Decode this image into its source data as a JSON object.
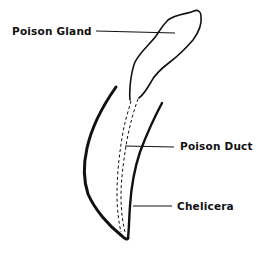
{
  "diagram": {
    "labels": {
      "gland": "Poison Gland",
      "duct": "Poison Duct",
      "chelicera": "Chelicera"
    },
    "colors": {
      "ink": "#111111",
      "background": "#ffffff"
    }
  }
}
